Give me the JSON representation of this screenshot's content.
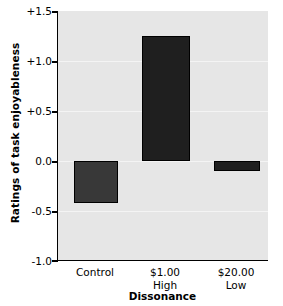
{
  "chart_data": {
    "type": "bar",
    "title": "",
    "subtitle": "",
    "xlabel": "Dissonance",
    "ylabel": "Ratings of task enjoyableness",
    "categories": [
      "Control",
      "$1.00\nHigh",
      "$20.00\nLow"
    ],
    "category_lines": [
      {
        "line1": "Control",
        "line2": ""
      },
      {
        "line1": "$1.00",
        "line2": "High"
      },
      {
        "line1": "$20.00",
        "line2": "Low"
      }
    ],
    "values": [
      -0.42,
      1.25,
      -0.1
    ],
    "ylim": [
      -1.0,
      1.5
    ],
    "yticks": [
      1.5,
      1.0,
      0.5,
      0.0,
      -0.5,
      -1.0
    ],
    "ytick_labels": [
      "+1.5",
      "+1.0",
      "+0.5",
      "0.0",
      "-0.5",
      "-1.0"
    ],
    "grid": true,
    "legend": "none",
    "bar_colors": [
      "#383838",
      "#1f1f1f",
      "#1f1f1f"
    ],
    "plot_background": "#e6e6e6",
    "gridline_color": "#f4f4f4",
    "axis_color": "#000000",
    "baseline_value": 0.0
  }
}
